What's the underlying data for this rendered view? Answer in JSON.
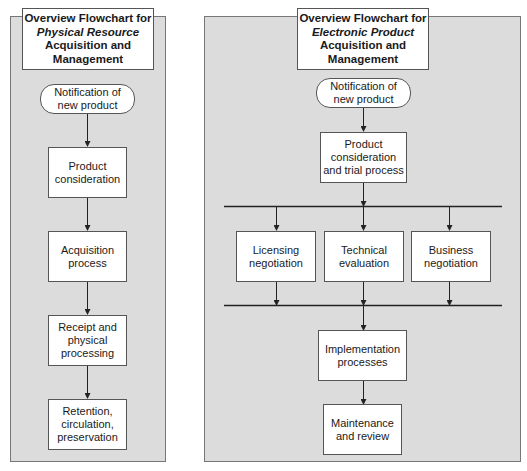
{
  "left_chart": {
    "title": {
      "line1": "Overview Flowchart for",
      "line2": "Physical Resource",
      "line3": "Acquisition and",
      "line4": "Management"
    },
    "nodes": [
      {
        "id": "notify",
        "shape": "rounded",
        "line1": "Notification of",
        "line2": "new product"
      },
      {
        "id": "consider",
        "shape": "rect",
        "line1": "Product",
        "line2": "consideration"
      },
      {
        "id": "acquire",
        "shape": "rect",
        "line1": "Acquisition",
        "line2": "process"
      },
      {
        "id": "receipt",
        "shape": "rect",
        "line1": "Receipt and",
        "line2": "physical",
        "line3": "processing"
      },
      {
        "id": "retention",
        "shape": "rect",
        "line1": "Retention,",
        "line2": "circulation,",
        "line3": "preservation"
      }
    ]
  },
  "right_chart": {
    "title": {
      "line1": "Overview Flowchart for",
      "line2": "Electronic Product",
      "line3": "Acquisition and",
      "line4": "Management"
    },
    "nodes": [
      {
        "id": "notify",
        "shape": "rounded",
        "line1": "Notification of",
        "line2": "new product"
      },
      {
        "id": "consider",
        "shape": "rect",
        "line1": "Product",
        "line2": "consideration",
        "line3": "and trial process"
      },
      {
        "id": "licensing",
        "shape": "rect",
        "line1": "Licensing",
        "line2": "negotiation"
      },
      {
        "id": "technical",
        "shape": "rect",
        "line1": "Technical",
        "line2": "evaluation"
      },
      {
        "id": "business",
        "shape": "rect",
        "line1": "Business",
        "line2": "negotiation"
      },
      {
        "id": "implement",
        "shape": "rect",
        "line1": "Implementation",
        "line2": "processes"
      },
      {
        "id": "maintain",
        "shape": "rect",
        "line1": "Maintenance",
        "line2": "and review"
      }
    ]
  },
  "colors": {
    "panel_bg": "#dcdcdc",
    "box_bg": "#ffffff",
    "line": "#222222"
  }
}
